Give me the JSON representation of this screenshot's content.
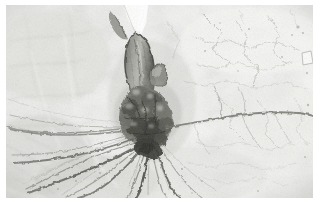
{
  "image": {
    "kind": "photograph",
    "subject": "fossil-specimen",
    "description": "Grayscale close-up photograph of a fossilized plant specimen preserved on a pale cracked rock matrix, showing a dark nodular cluster with radiating root-like filaments and an elongated stem structure above it.",
    "orientation": "landscape",
    "color_mode": "grayscale",
    "border": {
      "style": "solid-white-margin",
      "color": "#ffffff",
      "top_px": 5,
      "left_px": 6,
      "right_px": 7,
      "bottom_px": 10
    },
    "canvas": {
      "width_px": 320,
      "height_px": 208,
      "photo_width_px": 307,
      "photo_height_px": 193
    }
  },
  "palette": {
    "frame_white": "#ffffff",
    "matrix_lightest": "#f4f4f2",
    "matrix_light": "#e9e9e7",
    "matrix_mid": "#d6d6d3",
    "matrix_shadow": "#bdbdb9",
    "crack_grey": "#9a9a96",
    "fossil_mid": "#7a7a76",
    "fossil_dark": "#545450",
    "fossil_darkest": "#3a3a38",
    "highlight_white": "#fdfdfc"
  },
  "regions": [
    {
      "name": "upper-left-matrix",
      "label": "Pale mottled rock matrix, upper left quadrant",
      "tone": "#eeeeec"
    },
    {
      "name": "upper-right-matrix",
      "label": "Lightest rock matrix with fine hairline cracks, upper right",
      "tone": "#f2f2f0"
    },
    {
      "name": "bright-vertical-gap",
      "label": "Bright white vertical gap / fracture near top centre",
      "tone": "#fdfdfc"
    },
    {
      "name": "elongated-stem",
      "label": "Elongated dark-outlined stem or leaf structure, upper centre",
      "tone": "#6d6d69"
    },
    {
      "name": "nodular-cluster",
      "label": "Dense dark nodular fossil cluster at centre",
      "tone": "#4a4a47"
    },
    {
      "name": "radiating-filaments",
      "label": "Radiating root-like filaments fanning left and down from the cluster",
      "tone": "#6e6e6a"
    },
    {
      "name": "horizontal-crack",
      "label": "Long horizontal crack extending right from the cluster to the right edge",
      "tone": "#8b8b87"
    },
    {
      "name": "lower-left-matrix",
      "label": "Shadowed lower-left rock matrix with diagonal striations",
      "tone": "#dcdcd9"
    }
  ]
}
